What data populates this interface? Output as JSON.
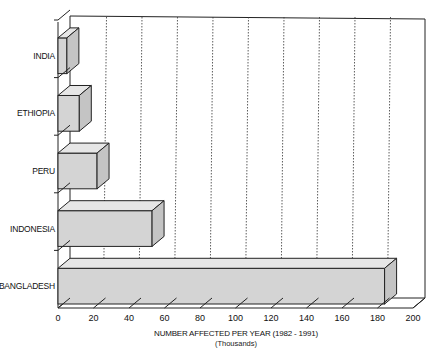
{
  "chart_data": {
    "type": "bar",
    "orientation": "horizontal",
    "style": "3d",
    "title": "",
    "categories": [
      "INDIA",
      "ETHIOPIA",
      "PERU",
      "INDONESIA",
      "BANGLADESH"
    ],
    "values": [
      5,
      12,
      22,
      53,
      184
    ],
    "xlabel": "NUMBER AFFECTED PER YEAR (1982 - 1991)",
    "xlabel_sub": "(Thousands)",
    "ylabel": "",
    "xlim": [
      0,
      200
    ],
    "xticks": [
      "0",
      "20",
      "40",
      "60",
      "80",
      "100",
      "120",
      "140",
      "160",
      "180",
      "200"
    ],
    "grid": "vertical dashed",
    "legend": null
  },
  "colors": {
    "bar_front": "#d4d4d4",
    "bar_top": "#e6e6e6",
    "bar_side": "#c4c4c4",
    "axis": "#222222",
    "grid": "#333333"
  }
}
